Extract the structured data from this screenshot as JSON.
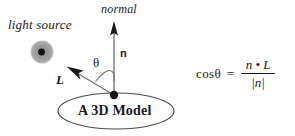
{
  "canvas": {
    "width": 295,
    "height": 136,
    "background": "#ffffff",
    "ink": "#1a1a1a"
  },
  "diagram": {
    "light_source": {
      "label": "light source",
      "glyph_outer_color": "#9a9a9a",
      "glyph_inner_color": "#141414",
      "center_x": 42,
      "center_y": 52,
      "outer_radius": 11,
      "inner_radius": 3.4
    },
    "normal_vector": {
      "label": "normal",
      "symbol": "n",
      "from_x": 114,
      "from_y": 95,
      "to_x": 114,
      "to_y": 22
    },
    "light_vector": {
      "symbol": "L",
      "from_x": 114,
      "from_y": 95,
      "to_x": 67,
      "to_y": 67
    },
    "angle": {
      "symbol": "θ"
    },
    "origin_point": {
      "x": 114,
      "y": 95,
      "radius": 4.2,
      "color": "#141414"
    },
    "surface": {
      "label": "A 3D Model",
      "center_x": 116,
      "center_y": 111,
      "radius_x": 58,
      "radius_y": 18,
      "stroke": "#4a4a4a"
    }
  },
  "equation": {
    "cos_text": "cos",
    "theta_symbol": "θ",
    "equals": "=",
    "numerator": "n • L",
    "denominator": "|n|"
  }
}
